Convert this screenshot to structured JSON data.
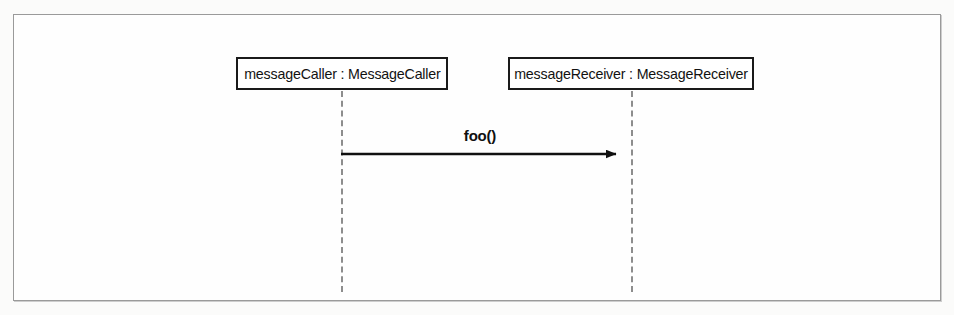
{
  "diagram": {
    "type": "uml-sequence-diagram",
    "frame": {
      "border_color": "#9a9a9a",
      "background_color": "#fefefe"
    },
    "participants": [
      {
        "id": "caller",
        "label": "messageCaller : MessageCaller",
        "instance_name": "messageCaller",
        "class_name": "MessageCaller",
        "box_border_color": "#1a1a1a",
        "lifeline_color": "#8d8d8d",
        "lifeline_style": "dashed"
      },
      {
        "id": "receiver",
        "label": "messageReceiver : MessageReceiver",
        "instance_name": "messageReceiver",
        "class_name": "MessageReceiver",
        "box_border_color": "#1a1a1a",
        "lifeline_color": "#8d8d8d",
        "lifeline_style": "dashed"
      }
    ],
    "messages": [
      {
        "id": "message-1",
        "label": "foo()",
        "from": "caller",
        "to": "receiver",
        "arrow_style": "solid-filled-head",
        "arrow_color": "#101010"
      }
    ]
  }
}
